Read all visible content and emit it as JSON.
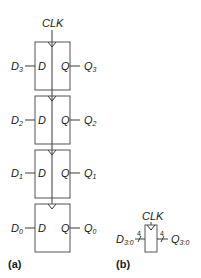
{
  "figure_a": {
    "clock_label": "CLK",
    "flip_flops": [
      {
        "d_in": "D",
        "d_sub": "3",
        "d_port": "D",
        "q_port": "Q",
        "q_out": "Q",
        "q_sub": "3"
      },
      {
        "d_in": "D",
        "d_sub": "2",
        "d_port": "D",
        "q_port": "Q",
        "q_out": "Q",
        "q_sub": "2"
      },
      {
        "d_in": "D",
        "d_sub": "1",
        "d_port": "D",
        "q_port": "Q",
        "q_out": "Q",
        "q_sub": "1"
      },
      {
        "d_in": "D",
        "d_sub": "0",
        "d_port": "D",
        "q_port": "Q",
        "q_out": "Q",
        "q_sub": "0"
      }
    ],
    "caption": "(a)"
  },
  "figure_b": {
    "clock_label": "CLK",
    "input_label": "D",
    "input_sub": "3:0",
    "output_label": "Q",
    "output_sub": "3:0",
    "bus_width_in": "4",
    "bus_width_out": "4",
    "caption": "(b)"
  },
  "colors": {
    "line": "#3a3a3a",
    "box_border": "#555555",
    "text": "#1a1a1a"
  }
}
